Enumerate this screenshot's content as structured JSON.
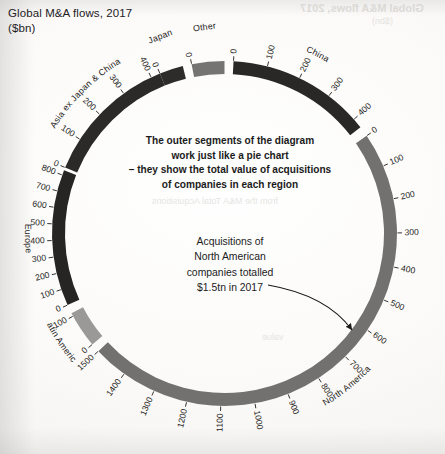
{
  "chart_data": {
    "type": "pie",
    "title": "Global M&A flows, 2017",
    "subtitle": "($bn)",
    "units": "$bn",
    "xlabel": "",
    "ylabel": "",
    "grid": false,
    "legend_position": "none",
    "note": "Outer ring of a chord diagram; each segment's arc length is the total value of acquisitions of companies in that region. Radial tick labels count $bn in increments of 100 along each segment.",
    "categories": [
      "Japan",
      "Other",
      "China",
      "North America",
      "Latin America",
      "Europe",
      "Asia ex Japan & China"
    ],
    "values": [
      60,
      95,
      430,
      1500,
      110,
      830,
      430
    ],
    "series": [
      {
        "name": "Value of acquisitions of companies in region ($bn)",
        "values": [
          60,
          95,
          430,
          1500,
          110,
          830,
          430
        ]
      }
    ],
    "segments": [
      {
        "label": "Japan",
        "value": 60,
        "color": "#2e2c2b",
        "start_angle_deg": -21.5,
        "end_angle_deg": -14.5,
        "axis_ticks": [
          0
        ],
        "axis_max": 60,
        "label_placement": "outside-radial"
      },
      {
        "label": "Other",
        "value": 95,
        "color": "#767472",
        "start_angle_deg": -11.5,
        "end_angle_deg": -0.5,
        "axis_ticks": [
          0
        ],
        "axis_max": 95,
        "label_placement": "outside-radial"
      },
      {
        "label": "China",
        "value": 430,
        "color": "#2a2827",
        "start_angle_deg": 2.5,
        "end_angle_deg": 52.0,
        "axis_ticks": [
          0,
          100,
          200,
          300,
          400
        ],
        "axis_max": 430,
        "label_placement": "along-arc"
      },
      {
        "label": "North America",
        "value": 1500,
        "color": "#737170",
        "start_angle_deg": 55.0,
        "end_angle_deg": 227.0,
        "axis_ticks": [
          0,
          100,
          200,
          300,
          400,
          500,
          600,
          700,
          800,
          900,
          1000,
          1100,
          1200,
          1300,
          1400,
          1500
        ],
        "axis_max": 1500,
        "label_placement": "along-arc"
      },
      {
        "label": "Latin America",
        "value": 110,
        "color": "#9b9997",
        "start_angle_deg": 230.0,
        "end_angle_deg": 242.5,
        "axis_ticks": [
          0,
          100
        ],
        "axis_max": 110,
        "label_placement": "along-arc"
      },
      {
        "label": "Europe",
        "value": 830,
        "color": "#272524",
        "start_angle_deg": 245.5,
        "end_angle_deg": 340.5,
        "axis_ticks": [
          0,
          100,
          200,
          300,
          400,
          500,
          600,
          700,
          800
        ],
        "axis_max": 830,
        "label_placement": "along-arc"
      },
      {
        "label": "Asia ex Japan & China",
        "value": 430,
        "color": "#2c2a29",
        "start_angle_deg": 293.0,
        "end_angle_deg": 338.0,
        "axis_ticks": [
          0,
          100,
          200,
          300,
          400
        ],
        "axis_max": 430,
        "label_placement": "along-arc"
      }
    ]
  },
  "header": {
    "title": "Global M&A flows, 2017",
    "subtitle": "($bn)"
  },
  "annotations": {
    "pie_note": {
      "line1": "The outer segments of the diagram",
      "line2": "work just like a pie chart",
      "line3": "– they show the total value of acquisitions",
      "line4": "of companies in each region"
    },
    "north_america_note": {
      "line1": "Acquisitions of",
      "line2": "North American",
      "line3": "companies totalled",
      "line4": "$1.5tn in 2017",
      "arrow": "curved-arrow-to-north-america-segment"
    }
  },
  "region_labels": {
    "japan": "Japan",
    "other": "Other",
    "china": "China",
    "north_america": "North America",
    "latin_america": "Latin America",
    "europe": "Europe",
    "asia_ex_japan_china": "Asia ex Japan & China"
  },
  "ticks": {
    "china": [
      "0",
      "100",
      "200",
      "300",
      "400"
    ],
    "north_america": [
      "0",
      "100",
      "200",
      "300",
      "400",
      "500",
      "600",
      "700",
      "800",
      "900",
      "1000",
      "1100",
      "1200",
      "1300",
      "1400",
      "1500"
    ],
    "latin_america": [
      "0",
      "100"
    ],
    "europe": [
      "0",
      "100",
      "200",
      "300",
      "400",
      "500",
      "600",
      "700",
      "800"
    ],
    "asia": [
      "0",
      "100",
      "200",
      "300",
      "400"
    ],
    "japan": [
      "0"
    ],
    "other": [
      "0"
    ]
  },
  "ghost_text": {
    "top_right_1": "Global M&A flows, 2017",
    "top_right_2": "($bn)",
    "mid": "from the M&A Total Acquisitions",
    "low": "value"
  },
  "colors": {
    "page_background": "#f7f6f3",
    "ink": "#1b1b1b",
    "segment_dark": "#2a2827",
    "segment_mid": "#737170",
    "segment_light": "#9b9997"
  }
}
